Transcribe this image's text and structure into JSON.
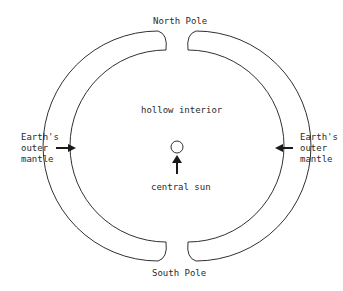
{
  "diagram": {
    "labels": {
      "north_pole": "North Pole",
      "south_pole": "South Pole",
      "hollow_interior": "hollow interior",
      "central_sun": "central sun",
      "left_mantle_line1": "Earth's",
      "left_mantle_line2": "outer",
      "left_mantle_line3": "mantle",
      "right_mantle_line1": "Earth's",
      "right_mantle_line2": "outer",
      "right_mantle_line3": "mantle"
    },
    "colors": {
      "stroke": "#1a1a1a",
      "text": "#2a2a2a",
      "background": "#ffffff"
    }
  }
}
